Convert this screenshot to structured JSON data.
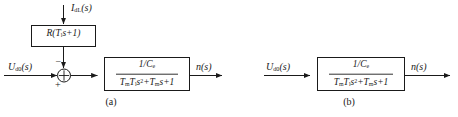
{
  "figure": {
    "panels": [
      {
        "id": "a",
        "caption": "(a)",
        "inputs": [
          {
            "name": "disturbance-input",
            "label_html": "I<sub>dL</sub>(s)",
            "label_text": "IdL(s)"
          },
          {
            "name": "control-input",
            "label_html": "U<sub>d0</sub>(s)",
            "label_text": "Ud0(s)"
          }
        ],
        "blocks": [
          {
            "name": "load-resistance-block",
            "type": "single",
            "expr_html": "R(T<sub>l</sub>s+1)",
            "expr_text": "R(Tls+1)"
          },
          {
            "name": "plant-transfer-function-block",
            "type": "fraction",
            "numerator_html": "1/C<sub>e</sub>",
            "numerator_text": "1/Ce",
            "denominator_html": "T<sub>m</sub>T<sub>l</sub>s<sup>2</sup>+T<sub>m</sub>s+1",
            "denominator_text": "TmTls^2+Tms+1"
          }
        ],
        "summing_junction": {
          "name": "summing-junction",
          "signs": {
            "top": "−",
            "left": "+"
          }
        },
        "output": {
          "name": "speed-output",
          "label_html": "n(s)",
          "label_text": "n(s)"
        }
      },
      {
        "id": "b",
        "caption": "(b)",
        "inputs": [
          {
            "name": "control-input",
            "label_html": "U<sub>d0</sub>(s)",
            "label_text": "Ud0(s)"
          }
        ],
        "blocks": [
          {
            "name": "plant-transfer-function-block",
            "type": "fraction",
            "numerator_html": "1/C<sub>e</sub>",
            "numerator_text": "1/Ce",
            "denominator_html": "T<sub>m</sub>T<sub>l</sub>s<sup>2</sup>+T<sub>m</sub>s+1",
            "denominator_text": "TmTls^2+Tms+1"
          }
        ],
        "output": {
          "name": "speed-output",
          "label_html": "n(s)",
          "label_text": "n(s)"
        }
      }
    ],
    "colors": {
      "line": "#1a1a1a",
      "text": "#1a1a1a",
      "background": "#ffffff"
    }
  }
}
